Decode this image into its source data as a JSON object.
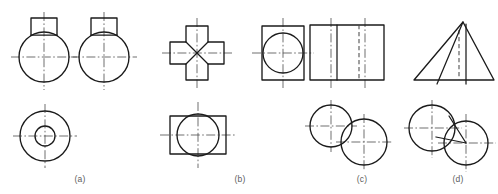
{
  "figure": {
    "background_color": "#ffffff",
    "line_color": "#1b1b1b",
    "hidden_line_color": "#4a4a4a",
    "center_line_color": "#555555",
    "caption_color": "#5d5d5d",
    "width": 498,
    "height": 194
  },
  "groups": [
    {
      "id": "a",
      "caption": "(a)",
      "caption_x": 80,
      "caption_y": 182,
      "views": [
        {
          "name": "front-view",
          "description": "circle with square boss on top",
          "circle": {
            "cx": 44,
            "cy": 57,
            "r": 25
          },
          "boss": {
            "x": 31,
            "y": 18,
            "w": 26,
            "h": 17
          },
          "center_v": {
            "x": 44,
            "y1": 12,
            "y2": 90
          },
          "center_h": {
            "y": 57,
            "x1": 11,
            "x2": 77
          }
        },
        {
          "name": "side-view",
          "description": "circle with square boss on top",
          "circle": {
            "cx": 104,
            "cy": 57,
            "r": 25
          },
          "boss": {
            "x": 91,
            "y": 18,
            "w": 26,
            "h": 17
          },
          "center_v": {
            "x": 104,
            "y1": 12,
            "y2": 90
          },
          "center_h": {
            "y": 57,
            "x1": 71,
            "x2": 137
          }
        },
        {
          "name": "top-view",
          "description": "two concentric circles",
          "circle_outer": {
            "cx": 45,
            "cy": 136,
            "r": 25
          },
          "circle_inner": {
            "cx": 45,
            "cy": 136,
            "r": 10
          },
          "center_v": {
            "x": 45,
            "y1": 104,
            "y2": 168
          },
          "center_h": {
            "y": 136,
            "x1": 13,
            "x2": 77
          }
        }
      ]
    },
    {
      "id": "b",
      "caption": "(b)",
      "caption_x": 240,
      "caption_y": 182,
      "views": [
        {
          "name": "front-view",
          "description": "cross shape with four diagonal edges meeting at centre",
          "cross": {
            "cx": 197,
            "cy": 53,
            "arm_half": 11,
            "outer_half": 27
          },
          "center_v": {
            "x": 197,
            "y1": 18,
            "y2": 88
          },
          "center_h": {
            "y": 53,
            "x1": 162,
            "x2": 232
          }
        },
        {
          "name": "side-view",
          "description": "upright rectangle with inscribed circle",
          "rect": {
            "x": 262,
            "y": 26,
            "w": 42,
            "h": 54
          },
          "circle": {
            "cx": 283,
            "cy": 53,
            "r": 20
          },
          "center_v": {
            "x": 283,
            "y1": 18,
            "y2": 88
          },
          "center_h": {
            "y": 53,
            "x1": 252,
            "x2": 314
          }
        },
        {
          "name": "top-view",
          "description": "horizontal rectangle with circle crossing top and bottom edges",
          "rect": {
            "x": 170,
            "y": 116,
            "w": 56,
            "h": 38
          },
          "circle": {
            "cx": 198,
            "cy": 135,
            "r": 21
          },
          "center_v": {
            "x": 198,
            "y1": 102,
            "y2": 168
          },
          "center_h": {
            "y": 135,
            "x1": 160,
            "x2": 237
          }
        }
      ]
    },
    {
      "id": "c",
      "caption": "(c)",
      "caption_x": 362,
      "caption_y": 182,
      "views": [
        {
          "name": "front-view",
          "description": "rectangle with one visible vertical edge and one hidden vertical edge",
          "rect": {
            "x": 310,
            "y": 25,
            "w": 74,
            "h": 55
          },
          "visible_edge_x": 337,
          "hidden_edge_x": 359,
          "center_left": {
            "x": 331,
            "y1": 18,
            "y2": 88
          },
          "center_right": {
            "x": 365,
            "y1": 18,
            "y2": 88
          }
        },
        {
          "name": "top-view",
          "description": "two overlapping circles, upper-left and lower-right",
          "circle_1": {
            "cx": 331,
            "cy": 126,
            "r": 21
          },
          "circle_2": {
            "cx": 364,
            "cy": 142,
            "r": 23
          },
          "center_1_v": {
            "x": 331,
            "y1": 100,
            "y2": 152
          },
          "center_1_h": {
            "y": 126,
            "x1": 305,
            "x2": 357
          },
          "center_2_v": {
            "x": 364,
            "y1": 114,
            "y2": 170
          },
          "center_2_h": {
            "y": 142,
            "x1": 336,
            "x2": 392
          }
        }
      ]
    },
    {
      "id": "d",
      "caption": "(d)",
      "caption_x": 458,
      "caption_y": 182,
      "views": [
        {
          "name": "front-view",
          "description": "triangle with apex, hidden axis, visible axis and slanted edge",
          "triangle": {
            "apex_x": 463,
            "apex_y": 22,
            "left_x": 414,
            "right_y": 80,
            "right_x": 494
          },
          "hidden_axis": {
            "x": 458,
            "y1": 30,
            "y2": 80
          },
          "visible_axis": {
            "x": 466,
            "y1": 26,
            "y2": 84
          },
          "slant_edge": {
            "x1": 463,
            "y1": 22,
            "x2": 438,
            "y2": 84
          }
        },
        {
          "name": "top-view",
          "description": "two overlapping circles with a wedge sector in the overlap",
          "circle_1": {
            "cx": 432,
            "cy": 128,
            "r": 23
          },
          "circle_2": {
            "cx": 466,
            "cy": 143,
            "r": 22
          },
          "wedge": {
            "apex_x": 466,
            "apex_y": 143,
            "p1_x": 436,
            "p1_y": 137,
            "p2_x": 448,
            "p2_y": 115
          },
          "center_1_v": {
            "x": 432,
            "y1": 100,
            "y2": 158
          },
          "center_1_h": {
            "y": 128,
            "x1": 404,
            "x2": 462
          },
          "center_2_v": {
            "x": 466,
            "y1": 114,
            "y2": 172
          },
          "center_2_h": {
            "y": 143,
            "x1": 438,
            "x2": 496
          }
        }
      ]
    }
  ]
}
